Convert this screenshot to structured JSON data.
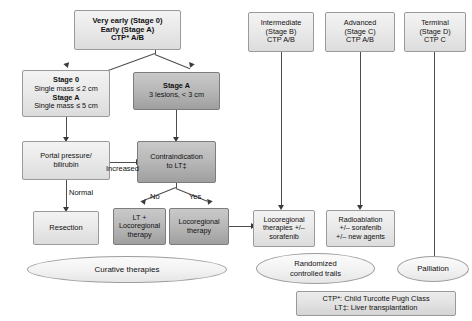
{
  "diagram": {
    "nodes": {
      "very_early": {
        "line1": "Very early (Stage 0)",
        "line2": "Early (Stage A)",
        "line3": "CTP* A/B"
      },
      "stage0_box": {
        "line1": "Stage 0",
        "line2": "Single mass ≤ 2 cm",
        "line3": "Stage A",
        "line4": "Single mass ≤ 5 cm"
      },
      "stageA_box": {
        "line1": "Stage A",
        "line2": "3 lesions, < 3 cm"
      },
      "portal": {
        "line1": "Portal pressure/",
        "line2": "bilirubin"
      },
      "contraindication": {
        "line1": "Contraindication",
        "line2": "to LT‡"
      },
      "resection": {
        "line1": "Resection"
      },
      "lt_locoregional": {
        "line1": "LT +",
        "line2": "Locoregional",
        "line3": "therapy"
      },
      "locoregional": {
        "line1": "Locoregional",
        "line2": "therapy"
      },
      "intermediate": {
        "line1": "Intermediate",
        "line2": "(Stage B)",
        "line3": "CTP A/B"
      },
      "advanced": {
        "line1": "Advanced",
        "line2": "(Stage C)",
        "line3": "CTP A/B"
      },
      "terminal": {
        "line1": "Terminal",
        "line2": "(Stage D)",
        "line3": "CTP C"
      },
      "locoregional_sorafenib": {
        "line1": "Locoregional",
        "line2": "therapies +/–",
        "line3": "sorafenib"
      },
      "radioablation": {
        "line1": "Radioablation",
        "line2": "+/– sorafenib",
        "line3": "+/– new agents"
      }
    },
    "outcomes": {
      "curative": "Curative therapies",
      "trials_line1": "Randomized",
      "trials_line2": "controlled trails",
      "palliation": "Palliation"
    },
    "edge_labels": {
      "increased": "Increased",
      "normal": "Normal",
      "no": "No",
      "yes": "Yes"
    },
    "legend": {
      "line1_abbr": "CTP*",
      "line1_text": ": Child Turcotte Pugh Class",
      "line2_abbr": "LT‡",
      "line2_text": ": Liver transplantation"
    }
  }
}
